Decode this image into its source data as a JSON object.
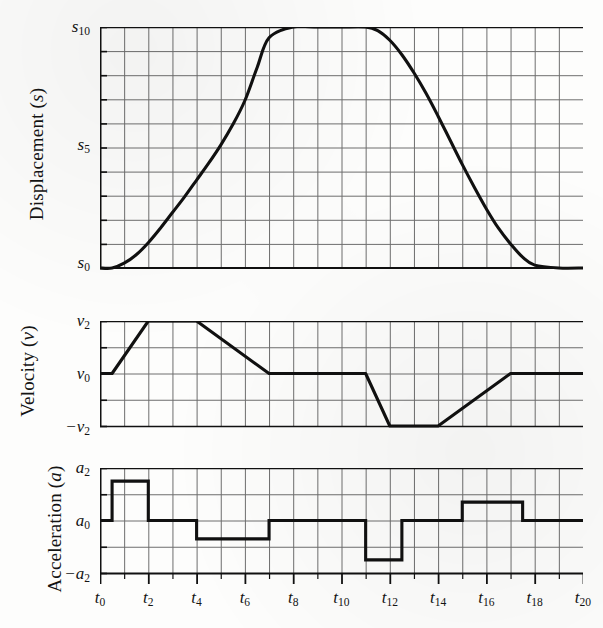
{
  "figure": {
    "background": "#fdfdfc",
    "curve_color": "#111111",
    "grid_color": "#6e6e6e",
    "axis_color": "#111111"
  },
  "panels": {
    "displacement": {
      "title_main": "Displacement (",
      "title_var": "s",
      "title_close": ")",
      "yticks": [
        {
          "base": "s",
          "sub": "0",
          "value": 0
        },
        {
          "base": "s",
          "sub": "5",
          "value": 5
        },
        {
          "base": "s",
          "sub": "10",
          "value": 10
        }
      ],
      "ylim": [
        0,
        10
      ],
      "ydivisions": 10
    },
    "velocity": {
      "title_main": "Velocity (",
      "title_var": "v",
      "title_close": ")",
      "yticks": [
        {
          "base": "−v",
          "sub": "2",
          "value": -2
        },
        {
          "base": "v",
          "sub": "0",
          "value": 0
        },
        {
          "base": "v",
          "sub": "2",
          "value": 2
        }
      ],
      "ylim": [
        -2,
        2
      ],
      "ydivisions": 4
    },
    "acceleration": {
      "title_main": "Acceleration (",
      "title_var": "a",
      "title_close": ")",
      "yticks": [
        {
          "base": "−a",
          "sub": "2",
          "value": -2
        },
        {
          "base": "a",
          "sub": "0",
          "value": 0
        },
        {
          "base": "a",
          "sub": "2",
          "value": 2
        }
      ],
      "ylim": [
        -2,
        2
      ],
      "ydivisions": 4
    }
  },
  "xaxis": {
    "base": "t",
    "xlim": [
      0,
      20
    ],
    "major_step": 2,
    "minor_step": 1,
    "ticks": [
      {
        "base": "t",
        "sub": "0",
        "value": 0
      },
      {
        "base": "t",
        "sub": "2",
        "value": 2
      },
      {
        "base": "t",
        "sub": "4",
        "value": 4
      },
      {
        "base": "t",
        "sub": "6",
        "value": 6
      },
      {
        "base": "t",
        "sub": "8",
        "value": 8
      },
      {
        "base": "t",
        "sub": "10",
        "value": 10
      },
      {
        "base": "t",
        "sub": "12",
        "value": 12
      },
      {
        "base": "t",
        "sub": "14",
        "value": 14
      },
      {
        "base": "t",
        "sub": "16",
        "value": 16
      },
      {
        "base": "t",
        "sub": "18",
        "value": 18
      },
      {
        "base": "t",
        "sub": "20",
        "value": 20
      }
    ]
  },
  "chart_data": [
    {
      "type": "line",
      "name": "displacement",
      "title": "Displacement (s)",
      "xlabel": "t",
      "ylabel": "Displacement (s)",
      "xlim": [
        0,
        20
      ],
      "ylim": [
        0,
        10
      ],
      "grid": true,
      "legend": "none",
      "x": [
        0,
        0.5,
        1,
        1.5,
        2,
        2.5,
        3,
        3.5,
        4,
        4.5,
        5,
        5.5,
        6,
        6.5,
        7,
        8,
        9,
        10,
        11,
        11.5,
        12,
        12.5,
        13,
        13.5,
        14,
        14.5,
        15,
        15.5,
        16,
        16.5,
        17,
        17.5,
        18,
        19,
        20
      ],
      "values": [
        0,
        0,
        0.2,
        0.55,
        1.05,
        1.65,
        2.3,
        2.95,
        3.65,
        4.35,
        5.1,
        5.95,
        6.95,
        8.3,
        9.55,
        10,
        10,
        10,
        10,
        9.85,
        9.45,
        8.85,
        8.1,
        7.25,
        6.3,
        5.3,
        4.3,
        3.35,
        2.45,
        1.65,
        1.0,
        0.45,
        0.12,
        0,
        0
      ]
    },
    {
      "type": "line",
      "name": "velocity",
      "title": "Velocity (v)",
      "xlabel": "t",
      "ylabel": "Velocity (v)",
      "xlim": [
        0,
        20
      ],
      "ylim": [
        -2,
        2
      ],
      "grid": true,
      "legend": "none",
      "x": [
        0,
        0.5,
        2,
        4,
        7,
        11,
        12,
        14,
        17,
        20
      ],
      "values": [
        0,
        0,
        2,
        2,
        0,
        0,
        -2,
        -2,
        0,
        0
      ]
    },
    {
      "type": "step",
      "name": "acceleration",
      "title": "Acceleration (a)",
      "xlabel": "t",
      "ylabel": "Acceleration (a)",
      "xlim": [
        -2,
        2
      ],
      "ylim": [
        -2,
        2
      ],
      "grid": true,
      "legend": "none",
      "segments": [
        {
          "x0": 0,
          "x1": 0.5,
          "y": 0
        },
        {
          "x0": 0.5,
          "x1": 2,
          "y": 1.5
        },
        {
          "x0": 2,
          "x1": 4,
          "y": 0
        },
        {
          "x0": 4,
          "x1": 7,
          "y": -0.7
        },
        {
          "x0": 7,
          "x1": 11,
          "y": 0
        },
        {
          "x0": 11,
          "x1": 12.5,
          "y": -1.5
        },
        {
          "x0": 12.5,
          "x1": 15,
          "y": 0
        },
        {
          "x0": 15,
          "x1": 17.5,
          "y": 0.7
        },
        {
          "x0": 17.5,
          "x1": 20,
          "y": 0
        }
      ]
    }
  ]
}
